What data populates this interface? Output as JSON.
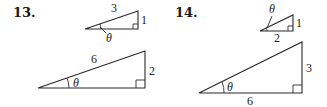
{
  "problems": [
    {
      "number": "13.",
      "small_triangle": {
        "hypotenuse": "3",
        "opposite": "1",
        "angle": "θ"
      },
      "large_triangle": {
        "hypotenuse": "6",
        "opposite": "2",
        "angle": "θ"
      }
    },
    {
      "number": "14.",
      "small_triangle": {
        "angle": "θ",
        "opposite": "1",
        "adjacent": "2"
      },
      "large_triangle": {
        "opposite": "3",
        "adjacent": "6",
        "angle": "θ"
      }
    }
  ],
  "colors": {
    "ink": "#2a2a2a",
    "background": "#ffffff"
  }
}
